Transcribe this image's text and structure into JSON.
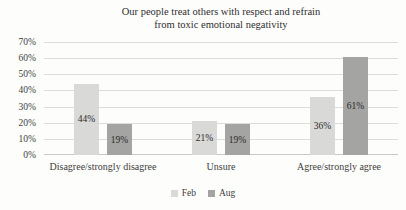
{
  "chart_data": {
    "type": "bar",
    "title": "Our people treat others with respect and refrain from toxic emotional negativity",
    "title_lines": [
      "Our people treat others with respect and refrain",
      "from toxic emotional negativity"
    ],
    "categories": [
      "Disagree/strongly disagree",
      "Unsure",
      "Agree/strongly agree"
    ],
    "series": [
      {
        "name": "Feb",
        "color": "#d9d9d7",
        "values": [
          44,
          21,
          36
        ],
        "labels": [
          "44%",
          "21%",
          "36%"
        ]
      },
      {
        "name": "Aug",
        "color": "#a4a4a2",
        "values": [
          19,
          19,
          61
        ],
        "labels": [
          "19%",
          "19%",
          "61%"
        ]
      }
    ],
    "xlabel": "",
    "ylabel": "",
    "ylim": [
      0,
      70
    ],
    "ytick_step": 10,
    "yticks": [
      "0%",
      "10%",
      "20%",
      "30%",
      "40%",
      "50%",
      "60%",
      "70%"
    ],
    "grid": true,
    "legend_position": "bottom",
    "colors": {
      "grid": "#dcdcda",
      "baseline": "#c9c9c7",
      "text": "#3d3d3d",
      "background": "#fdfdfc"
    }
  }
}
